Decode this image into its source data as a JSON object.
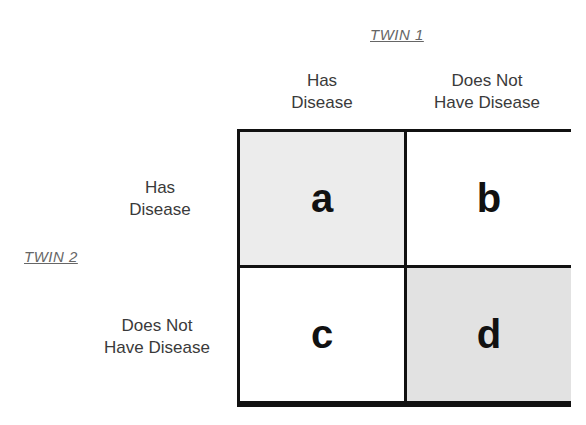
{
  "column_group": {
    "label": "TWIN 1",
    "columns": [
      {
        "line1": "Has",
        "line2": "Disease"
      },
      {
        "line1": "Does Not",
        "line2": "Have Disease"
      }
    ]
  },
  "row_group": {
    "label": "TWIN 2",
    "rows": [
      {
        "line1": "Has",
        "line2": "Disease"
      },
      {
        "line1": "Does Not",
        "line2": "Have Disease"
      }
    ]
  },
  "cells": [
    {
      "label": "a",
      "fill": "#ececec"
    },
    {
      "label": "b",
      "fill": "#ffffff"
    },
    {
      "label": "c",
      "fill": "#ffffff"
    },
    {
      "label": "d",
      "fill": "#e2e2e2"
    }
  ],
  "colors": {
    "border": "#111111",
    "text": "#3a3a3a",
    "group_label": "#666666"
  }
}
